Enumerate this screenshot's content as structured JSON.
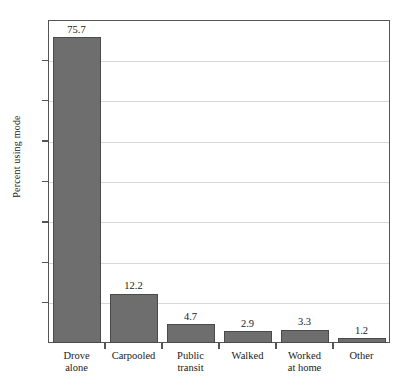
{
  "chart_data": {
    "type": "bar",
    "title": "",
    "xlabel": "",
    "ylabel": "Percent using mode",
    "ylim": [
      0,
      80
    ],
    "yticks": [
      0,
      10,
      20,
      30,
      40,
      50,
      60,
      70,
      80
    ],
    "grid": true,
    "legend": "none",
    "categories": [
      "Drove alone",
      "Carpooled",
      "Public transit",
      "Walked",
      "Worked at home",
      "Other"
    ],
    "category_lines": [
      [
        "Drove",
        "alone"
      ],
      [
        "Carpooled",
        ""
      ],
      [
        "Public",
        "transit"
      ],
      [
        "Walked",
        ""
      ],
      [
        "Worked",
        "at home"
      ],
      [
        "Other",
        ""
      ]
    ],
    "values": [
      75.7,
      12.2,
      4.7,
      2.9,
      3.3,
      1.2
    ],
    "value_labels": [
      "75.7",
      "12.2",
      "4.7",
      "2.9",
      "3.3",
      "1.2"
    ],
    "bar_color": "#6e6e6e",
    "bar_edge_color": "#4a4a4a",
    "gridline_color": "#d8d8d8",
    "axis_color": "#555555"
  },
  "axis": {
    "y_tick_labels": [
      "80",
      "70",
      "60",
      "50",
      "40",
      "30",
      "20",
      "10",
      "0"
    ],
    "y_title": "Percent using mode"
  },
  "caption": {
    "text": ""
  }
}
